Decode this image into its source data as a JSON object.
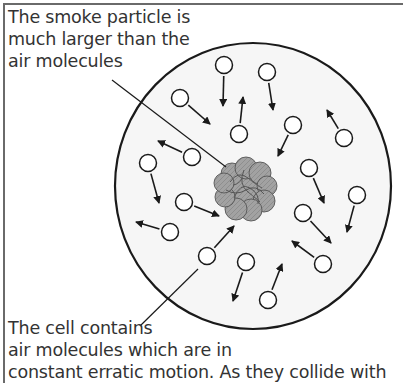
{
  "diagram": {
    "labels": {
      "smoke_particle": [
        "The smoke particle is",
        "much larger than the",
        "air molecules"
      ],
      "cell": [
        "The cell contains",
        "air molecules which are in",
        "constant erratic motion. As they collide with"
      ]
    },
    "colors": {
      "outline": "#1a1a1a",
      "text": "#333333",
      "cell_fill": "#f6f6f6",
      "particle_fill": "#9a9a9a",
      "particle_stroke": "#555555",
      "frame": "#6a6a6a"
    },
    "cell": {
      "cx": 253,
      "cy": 186,
      "rx": 138,
      "ry": 143
    },
    "smoke_particle": {
      "cx": 246,
      "cy": 188,
      "r": 28
    },
    "molecules": [
      {
        "x": 224,
        "y": 65,
        "ax": 223,
        "ay": 106
      },
      {
        "x": 267,
        "y": 72,
        "ax": 273,
        "ay": 110
      },
      {
        "x": 180,
        "y": 98,
        "ax": 210,
        "ay": 124
      },
      {
        "x": 239,
        "y": 134,
        "ax": 243,
        "ay": 97
      },
      {
        "x": 293,
        "y": 125,
        "ax": 278,
        "ay": 156
      },
      {
        "x": 344,
        "y": 138,
        "ax": 327,
        "ay": 110
      },
      {
        "x": 192,
        "y": 157,
        "ax": 158,
        "ay": 141
      },
      {
        "x": 148,
        "y": 163,
        "ax": 159,
        "ay": 203
      },
      {
        "x": 309,
        "y": 168,
        "ax": 324,
        "ay": 203
      },
      {
        "x": 357,
        "y": 195,
        "ax": 347,
        "ay": 232
      },
      {
        "x": 184,
        "y": 202,
        "ax": 219,
        "ay": 216
      },
      {
        "x": 303,
        "y": 213,
        "ax": 331,
        "ay": 243
      },
      {
        "x": 170,
        "y": 232,
        "ax": 136,
        "ay": 222
      },
      {
        "x": 207,
        "y": 256,
        "ax": 234,
        "ay": 226
      },
      {
        "x": 323,
        "y": 264,
        "ax": 292,
        "ay": 241
      },
      {
        "x": 246,
        "y": 262,
        "ax": 233,
        "ay": 301
      },
      {
        "x": 268,
        "y": 300,
        "ax": 282,
        "ay": 264
      }
    ],
    "leaders": [
      {
        "name": "smoke-particle-leader",
        "x1": 112,
        "y1": 80,
        "x2": 226,
        "y2": 167
      },
      {
        "name": "cell-leader",
        "x1": 140,
        "y1": 326,
        "x2": 198,
        "y2": 269
      }
    ]
  }
}
